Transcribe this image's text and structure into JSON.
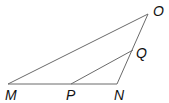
{
  "diagram": {
    "type": "geometry-triangle",
    "points": {
      "O": {
        "label": "O",
        "x": 148,
        "y": 14
      },
      "Q": {
        "label": "Q",
        "x": 133,
        "y": 50
      },
      "M": {
        "label": "M",
        "x": 8,
        "y": 84
      },
      "P": {
        "label": "P",
        "x": 71,
        "y": 84
      },
      "N": {
        "label": "N",
        "x": 117,
        "y": 84
      }
    },
    "segments": [
      [
        "M",
        "O"
      ],
      [
        "M",
        "N"
      ],
      [
        "N",
        "O"
      ],
      [
        "P",
        "Q"
      ]
    ],
    "colors": {
      "line": "#6a6a6a",
      "label": "#111111",
      "background": "#ffffff"
    }
  }
}
